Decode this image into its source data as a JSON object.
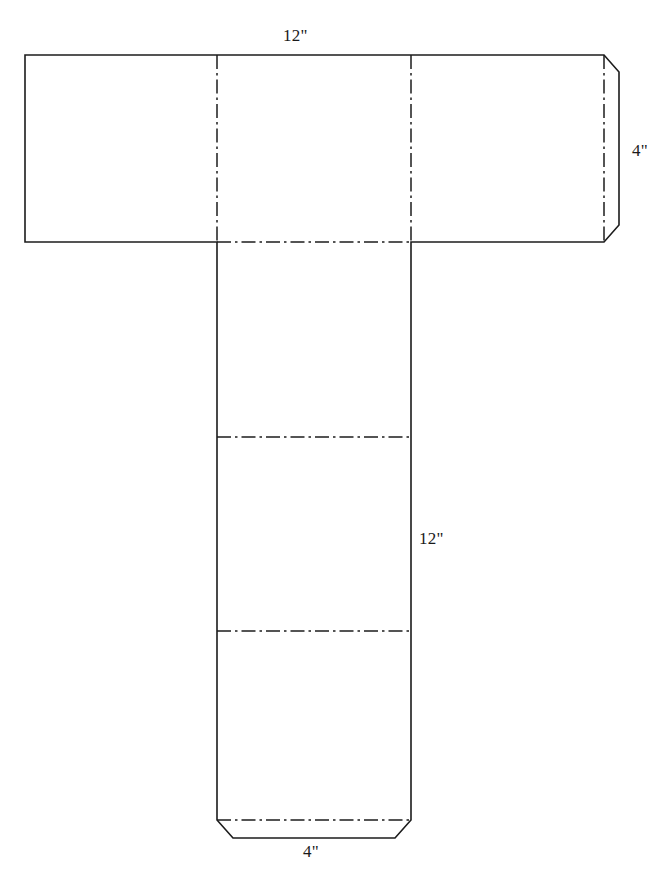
{
  "diagram": {
    "background_color": "#ffffff",
    "line_color": "#1c1c1c",
    "dimensions": [
      {
        "id": "top-width",
        "value": "12\"",
        "position": "top",
        "measures": "horizontal-band-width"
      },
      {
        "id": "right-height",
        "value": "4\"",
        "position": "right",
        "measures": "horizontal-band-height"
      },
      {
        "id": "column-height",
        "value": "12\"",
        "position": "column-right",
        "measures": "vertical-column-height"
      },
      {
        "id": "bottom-width",
        "value": "4\"",
        "position": "bottom",
        "measures": "vertical-column-width"
      }
    ],
    "panels": [
      {
        "id": "band-panel-left",
        "kind": "face"
      },
      {
        "id": "band-panel-middle",
        "kind": "face"
      },
      {
        "id": "band-panel-right",
        "kind": "face"
      },
      {
        "id": "right-glue-tab",
        "kind": "tab"
      },
      {
        "id": "column-panel-top",
        "kind": "face"
      },
      {
        "id": "column-panel-middle",
        "kind": "face"
      },
      {
        "id": "column-panel-bottom",
        "kind": "face"
      },
      {
        "id": "bottom-glue-tab",
        "kind": "tab"
      }
    ],
    "fold_lines": [
      {
        "id": "fold-vertical-left",
        "orientation": "vertical"
      },
      {
        "id": "fold-vertical-right",
        "orientation": "vertical"
      },
      {
        "id": "fold-tab-right",
        "orientation": "vertical"
      },
      {
        "id": "fold-band-to-column",
        "orientation": "horizontal"
      },
      {
        "id": "fold-column-upper",
        "orientation": "horizontal"
      },
      {
        "id": "fold-column-lower",
        "orientation": "horizontal"
      },
      {
        "id": "fold-tab-bottom",
        "orientation": "horizontal"
      }
    ]
  }
}
